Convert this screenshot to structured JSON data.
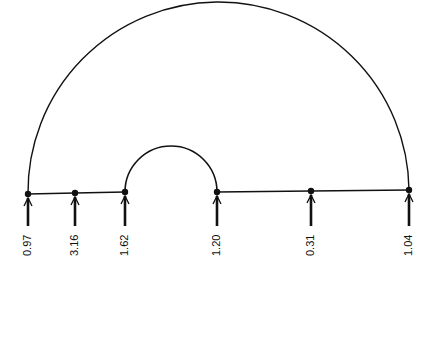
{
  "diagram": {
    "type": "arc-diagram",
    "line_color": "#111111",
    "background": "#ffffff",
    "nodes": [
      {
        "x": 28,
        "y": 194,
        "label": "0.97"
      },
      {
        "x": 75,
        "y": 193,
        "label": "3.16"
      },
      {
        "x": 125,
        "y": 192,
        "label": "1.62"
      },
      {
        "x": 217,
        "y": 192,
        "label": "1.20"
      },
      {
        "x": 311,
        "y": 191,
        "label": "0.31"
      },
      {
        "x": 409,
        "y": 190,
        "label": "1.04"
      }
    ],
    "segments": [
      [
        0,
        1
      ],
      [
        1,
        2
      ],
      [
        3,
        4
      ],
      [
        4,
        5
      ]
    ],
    "arcs": [
      {
        "from": 0,
        "to": 5,
        "name": "outer-arc"
      },
      {
        "from": 2,
        "to": 3,
        "name": "inner-arc"
      }
    ]
  }
}
